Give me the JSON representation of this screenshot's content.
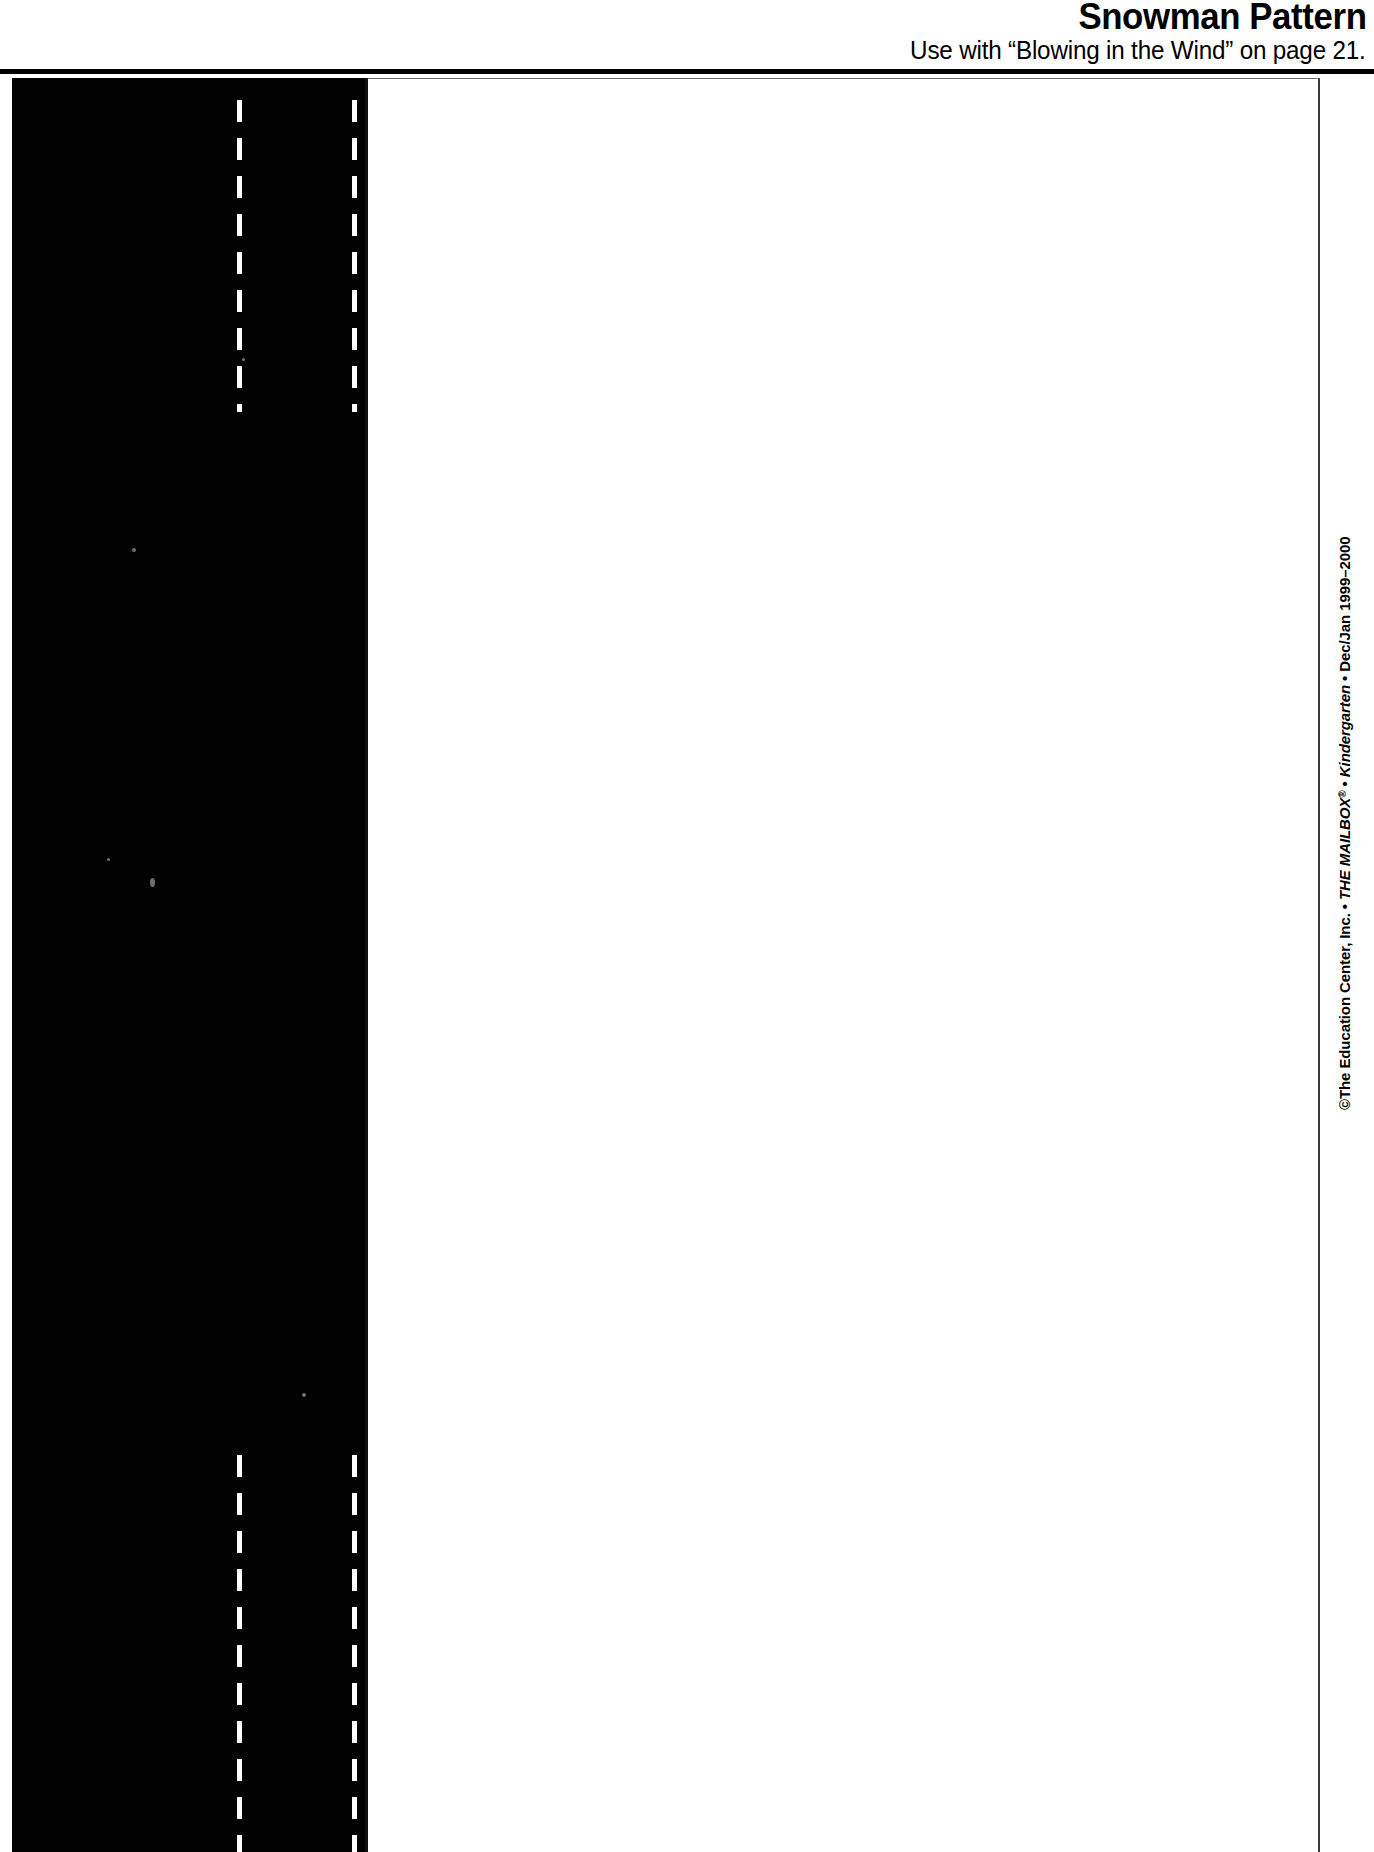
{
  "page": {
    "width": 1374,
    "height": 1852,
    "background_color": "#ffffff",
    "ink_color": "#000000"
  },
  "header": {
    "title": "Snowman Pattern",
    "subtitle": "Use with “Blowing in the Wind” on page 21."
  },
  "artwork": {
    "description": "Snowman pattern silhouette — solid black cut area with white dashed fold lines and a white panel",
    "black_region_color": "#020202",
    "panel_color": "#ffffff",
    "fold_line_color": "#ffffff"
  },
  "credit": {
    "copyright_symbol": "©",
    "publisher": "The Education Center, Inc.",
    "separator": "•",
    "magazine": "THE MAILBOX",
    "registered_mark": "®",
    "grade_level": "Kindergarten",
    "issue": "Dec/Jan 1999–2000",
    "full_text": "©The Education Center, Inc. • THE MAILBOX® • Kindergarten • Dec/Jan 1999–2000"
  }
}
